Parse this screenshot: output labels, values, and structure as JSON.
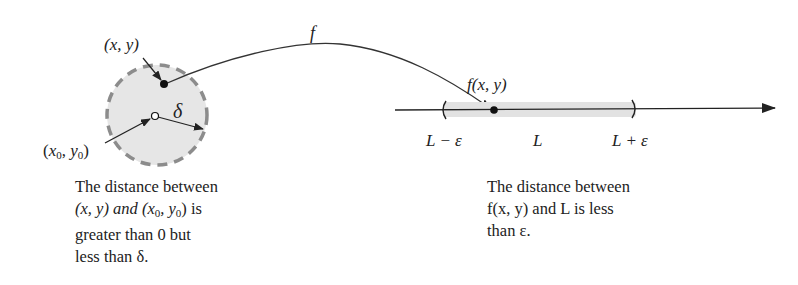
{
  "figure": {
    "domain_disk": {
      "point_label": "(x, y)",
      "center_label_x": "x",
      "center_label_y": "y",
      "center_subscript": "0",
      "radius_label": "δ",
      "colors": {
        "fill": "#e6e6e6",
        "border": "#8c8c8c"
      }
    },
    "mapping": {
      "label": "f"
    },
    "number_line": {
      "image_label": "f(x, y)",
      "left_label": "L − ε",
      "center_label": "L",
      "right_label": "L + ε",
      "colors": {
        "interval": "#e2e2e2",
        "axis": "#222222"
      }
    },
    "captions": {
      "left": {
        "line1": "The distance between",
        "line2_a": "(x, y) and (x",
        "line2_sub1": "0",
        "line2_b": ", y",
        "line2_sub2": "0",
        "line2_c": ") is",
        "line3": "greater than 0 but",
        "line4": "less than δ."
      },
      "right": {
        "line1": "The distance between",
        "line2": "f(x, y) and L is less",
        "line3": "than ε."
      }
    }
  }
}
